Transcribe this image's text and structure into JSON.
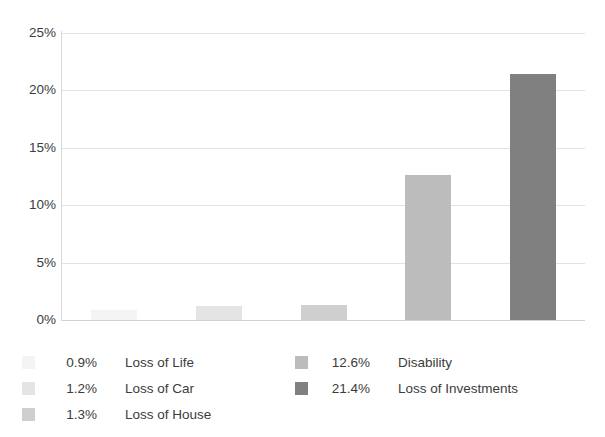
{
  "chart_data": {
    "type": "bar",
    "title": "",
    "subtitle": "",
    "xlabel": "",
    "ylabel": "",
    "categories": [
      "Loss of Life",
      "Loss of Car",
      "Loss of House",
      "Disability",
      "Loss of Investments"
    ],
    "values": [
      0.9,
      1.2,
      1.3,
      12.6,
      21.4
    ],
    "value_labels": [
      "0.9%",
      "1.2%",
      "1.3%",
      "12.6%",
      "21.4%"
    ],
    "colors": [
      "#f4f4f4",
      "#e4e4e4",
      "#cfcfcf",
      "#bcbcbc",
      "#808080"
    ],
    "ylim": [
      0,
      25
    ],
    "yticks": [
      0,
      5,
      10,
      15,
      20,
      25
    ],
    "ytick_labels": [
      "0%",
      "5%",
      "10%",
      "15%",
      "20%",
      "25%"
    ],
    "grid": true,
    "legend_position": "bottom",
    "legend_columns": 2,
    "background_color": "#ffffff",
    "grid_color": "#e2e2e2",
    "axis_color": "#d8d8d8",
    "text_color": "#3c3c3c"
  },
  "legend": {
    "left_column": [
      {
        "value": "0.9%",
        "label": "Loss of Life",
        "color": "#f4f4f4"
      },
      {
        "value": "1.2%",
        "label": "Loss of Car",
        "color": "#e4e4e4"
      },
      {
        "value": "1.3%",
        "label": "Loss of House",
        "color": "#cfcfcf"
      }
    ],
    "right_column": [
      {
        "value": "12.6%",
        "label": "Disability",
        "color": "#bcbcbc"
      },
      {
        "value": "21.4%",
        "label": "Loss of Investments",
        "color": "#808080"
      }
    ]
  }
}
